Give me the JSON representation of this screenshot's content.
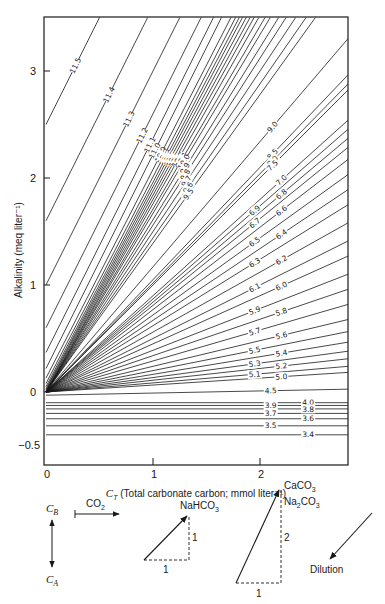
{
  "chart_data": {
    "type": "line",
    "title": "",
    "xlabel": "C_T (Total carbonate carbon; mmol liter^-1)",
    "ylabel": "Alkalinity (meq liter^-1)",
    "xlim": [
      0,
      2.8
    ],
    "ylim": [
      -0.5,
      3.5
    ],
    "x_ticks": [
      "0",
      "1",
      "2"
    ],
    "y_ticks": [
      "-0.5",
      "0",
      "1",
      "2",
      "3"
    ],
    "grid": false,
    "series_note": "slope = alkalinity per unit C_T; intercept = alkalinity at C_T = 0",
    "ph_isolines": [
      {
        "pH": "11.5",
        "intercept": 2.5,
        "slope": 2.0
      },
      {
        "pH": "11.4",
        "intercept": 1.6,
        "slope": 2.0
      },
      {
        "pH": "11.3",
        "intercept": 1.0,
        "slope": 2.0
      },
      {
        "pH": "11.2",
        "intercept": 0.6,
        "slope": 2.0
      },
      {
        "pH": "11.1",
        "intercept": 0.37,
        "slope": 2.0
      },
      {
        "pH": "11.0",
        "intercept": 0.22,
        "slope": 2.0
      },
      {
        "pH": "10.9",
        "intercept": 0.13,
        "slope": 1.95
      },
      {
        "pH": "10.8",
        "intercept": 0.08,
        "slope": 1.93
      },
      {
        "pH": "10.7",
        "intercept": 0.05,
        "slope": 1.91
      },
      {
        "pH": "10.6",
        "intercept": 0.03,
        "slope": 1.89
      },
      {
        "pH": "10.5",
        "intercept": 0.02,
        "slope": 1.86
      },
      {
        "pH": "10.4",
        "intercept": 0.01,
        "slope": 1.83
      },
      {
        "pH": "10.3",
        "intercept": 0.0,
        "slope": 1.8
      },
      {
        "pH": "10.2",
        "intercept": 0.0,
        "slope": 1.76
      },
      {
        "pH": "10.1",
        "intercept": 0.0,
        "slope": 1.71
      },
      {
        "pH": "10.0",
        "intercept": 0.0,
        "slope": 1.67
      },
      {
        "pH": "9.9",
        "intercept": 0.0,
        "slope": 1.61
      },
      {
        "pH": "9.8",
        "intercept": 0.0,
        "slope": 1.56
      },
      {
        "pH": "9.7",
        "intercept": 0.0,
        "slope": 1.5
      },
      {
        "pH": "9.6",
        "intercept": 0.0,
        "slope": 1.44
      },
      {
        "pH": "9.5",
        "intercept": 0.0,
        "slope": 1.39
      },
      {
        "pH": "9.0",
        "intercept": 0.0,
        "slope": 1.17
      },
      {
        "pH": "8.5",
        "intercept": 0.0,
        "slope": 1.05
      },
      {
        "pH": "8.0",
        "intercept": 0.0,
        "slope": 1.02
      },
      {
        "pH": "7.5",
        "intercept": 0.0,
        "slope": 1.0
      },
      {
        "pH": "7.0",
        "intercept": 0.0,
        "slope": 0.9
      },
      {
        "pH": "6.9",
        "intercept": 0.0,
        "slope": 0.87
      },
      {
        "pH": "6.8",
        "intercept": 0.0,
        "slope": 0.84
      },
      {
        "pH": "6.7",
        "intercept": 0.0,
        "slope": 0.81
      },
      {
        "pH": "6.6",
        "intercept": 0.0,
        "slope": 0.77
      },
      {
        "pH": "6.5",
        "intercept": 0.0,
        "slope": 0.72
      },
      {
        "pH": "6.4",
        "intercept": 0.0,
        "slope": 0.67
      },
      {
        "pH": "6.3",
        "intercept": 0.0,
        "slope": 0.62
      },
      {
        "pH": "6.2",
        "intercept": 0.0,
        "slope": 0.56
      },
      {
        "pH": "6.1",
        "intercept": 0.0,
        "slope": 0.5
      },
      {
        "pH": "6.0",
        "intercept": 0.0,
        "slope": 0.45
      },
      {
        "pH": "5.9",
        "intercept": 0.0,
        "slope": 0.39
      },
      {
        "pH": "5.8",
        "intercept": 0.0,
        "slope": 0.34
      },
      {
        "pH": "5.7",
        "intercept": 0.0,
        "slope": 0.29
      },
      {
        "pH": "5.6",
        "intercept": 0.0,
        "slope": 0.24
      },
      {
        "pH": "5.5",
        "intercept": 0.0,
        "slope": 0.2
      },
      {
        "pH": "5.4",
        "intercept": 0.0,
        "slope": 0.165
      },
      {
        "pH": "5.3",
        "intercept": 0.0,
        "slope": 0.135
      },
      {
        "pH": "5.2",
        "intercept": 0.0,
        "slope": 0.11
      },
      {
        "pH": "5.1",
        "intercept": 0.0,
        "slope": 0.085
      },
      {
        "pH": "5.0",
        "intercept": 0.0,
        "slope": 0.065
      },
      {
        "pH": "4.5",
        "intercept": -0.03,
        "slope": 0.02
      },
      {
        "pH": "4.0",
        "intercept": -0.1,
        "slope": 0.0
      },
      {
        "pH": "3.9",
        "intercept": -0.126,
        "slope": 0.0
      },
      {
        "pH": "3.8",
        "intercept": -0.158,
        "slope": 0.0
      },
      {
        "pH": "3.7",
        "intercept": -0.2,
        "slope": 0.0
      },
      {
        "pH": "3.6",
        "intercept": -0.25,
        "slope": 0.0
      },
      {
        "pH": "3.5",
        "intercept": -0.316,
        "slope": 0.0
      },
      {
        "pH": "3.4",
        "intercept": -0.4,
        "slope": 0.0
      }
    ],
    "contour_labels": [
      "11.5",
      "11.4",
      "11.3",
      "11.2",
      "11.1",
      "11.0",
      "10.9",
      "10.8",
      "10.7",
      "10.6",
      "10.5",
      "10.4",
      "10.3",
      "10.2",
      "10.1",
      "10.0",
      "9.9",
      "9.8",
      "9.7",
      "9.6",
      "9.5",
      "9.0",
      "8.5",
      "8.0",
      "7.5",
      "7.0",
      "6.9",
      "6.8",
      "6.7",
      "6.6",
      "6.5",
      "6.4",
      "6.3",
      "6.2",
      "6.1",
      "6.0",
      "5.9",
      "5.8",
      "5.7",
      "5.6",
      "5.5",
      "5.4",
      "5.3",
      "5.2",
      "5.1",
      "5.0",
      "4.5",
      "4.0",
      "3.9",
      "3.8",
      "3.7",
      "3.6",
      "3.5",
      "3.4"
    ]
  },
  "axes": {
    "y_label": "Alkalinity (meq liter⁻¹)",
    "x_label_symbol": "C",
    "x_label_sub": "T",
    "x_label_rest": " (Total carbonate carbon; mmol liter⁻¹)",
    "y_ticks": [
      {
        "label": "3",
        "value": 3
      },
      {
        "label": "2",
        "value": 2
      },
      {
        "label": "1",
        "value": 1
      },
      {
        "label": "0",
        "value": 0
      },
      {
        "label": "−0.5",
        "value": -0.5
      }
    ],
    "x_ticks": [
      {
        "label": "0",
        "value": 0
      },
      {
        "label": "1",
        "value": 1
      },
      {
        "label": "2",
        "value": 2
      }
    ]
  },
  "legend": {
    "cb_label": "C",
    "cb_sub": "B",
    "ca_label": "C",
    "ca_sub": "A",
    "co2_label": "CO",
    "co2_sub": "2",
    "nahco3_label": "NaHCO",
    "nahco3_sub": "3",
    "nahco3_dx": "1",
    "nahco3_dy": "1",
    "caco3_label": "CaCO",
    "caco3_sub": "3",
    "na2co3_label_a": "Na",
    "na2co3_sub_a": "2",
    "na2co3_label_b": "CO",
    "na2co3_sub_b": "3",
    "carbonate_dx": "1",
    "carbonate_dy": "2",
    "dilution_label": "Dilution"
  },
  "colors": {
    "ink": "#1a1a1a",
    "paper": "#ffffff"
  }
}
